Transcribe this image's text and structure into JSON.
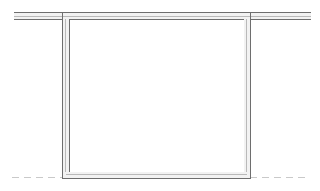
{
  "drawing": {
    "title": "Structural Section Line Drawing",
    "canvas": {
      "width": 320,
      "height": 191,
      "background_color": "#ffffff"
    },
    "colors": {
      "line_dark": "#6e6e6e",
      "line_mid": "#8f8f8f",
      "line_light": "#b9b9b9",
      "dashed_line": "#c9c9c9",
      "interior_fill": "#ffffff"
    },
    "elements": {
      "top_beam": {
        "name": "Top horizontal double line",
        "x_start": 14,
        "x_end": 311,
        "y_outer": 12,
        "y_inner": 19,
        "thickness": 7
      },
      "left_wall": {
        "name": "Left vertical double line",
        "x_outer": 62,
        "x_inner": 69,
        "y_start": 12,
        "y_end": 178,
        "thickness": 7
      },
      "right_wall": {
        "name": "Right vertical double line",
        "x_outer": 250,
        "x_inner": 243,
        "y_start": 12,
        "y_end": 178,
        "thickness": 7
      },
      "bottom_sill": {
        "name": "Bottom horizontal double line",
        "x_start": 62,
        "x_end": 250,
        "y_inner": 171,
        "y_outer": 178,
        "thickness": 7
      },
      "ground_line": {
        "name": "Dashed ground reference line",
        "y": 177,
        "left_segment": {
          "x_start": 12,
          "x_end": 62
        },
        "right_segment": {
          "x_start": 250,
          "x_end": 308
        },
        "dash_pattern": "7 5",
        "stroke_width": 1
      },
      "opening": {
        "name": "Interior opening area",
        "x": 69,
        "y": 19,
        "width": 174,
        "height": 152
      }
    },
    "view_label": "",
    "scale_label": "",
    "dimension_labels": []
  }
}
